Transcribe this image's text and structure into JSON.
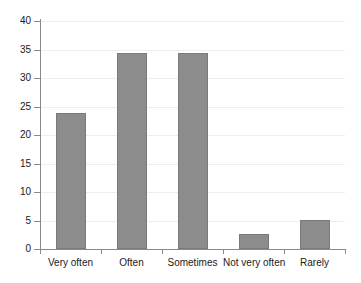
{
  "chart_data": {
    "type": "bar",
    "title": "",
    "subtitle": "",
    "xlabel": "",
    "ylabel": "",
    "categories": [
      "Very often",
      "Often",
      "Sometimes",
      "Not very often",
      "Rarely"
    ],
    "values": [
      23.8,
      34.4,
      34.4,
      2.7,
      5.1
    ],
    "ylim": [
      0,
      40
    ],
    "yticks": [
      0,
      5,
      10,
      15,
      20,
      25,
      30,
      35,
      40
    ],
    "ytick_labels": [
      "0",
      "5",
      "10",
      "15",
      "20",
      "25",
      "30",
      "35",
      "40"
    ],
    "grid": true,
    "grid_axis": "y",
    "legend": false,
    "legend_position": "none",
    "bar_color": "#8c8c8c",
    "bar_edge_color": "#7a7a7a",
    "grid_color": "#eeeeee",
    "axis_color": "#8a8a8a",
    "text_color": "#1a1a1a",
    "background": "#ffffff"
  }
}
